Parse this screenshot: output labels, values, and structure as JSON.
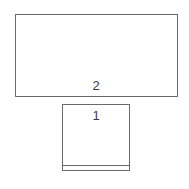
{
  "diagram": {
    "canvas": {
      "width": 189,
      "height": 189,
      "background_color": "#ffffff"
    },
    "stroke_color": "#6a6a6a",
    "label_color": "#3c3c3c",
    "stroke_width": 1,
    "shapes": [
      {
        "id": "rect-2",
        "kind": "rectangle",
        "label": "2",
        "x": 15,
        "y": 14,
        "width": 163,
        "height": 83,
        "label_x": 96,
        "label_y": 79,
        "fill_color": "#ffffff",
        "stroke_color": "#6a6a6a"
      },
      {
        "id": "rect-1",
        "kind": "rectangle",
        "label": "1",
        "x": 62,
        "y": 104,
        "width": 68,
        "height": 67,
        "label_x": 96,
        "label_y": 109,
        "fill_color": "#ffffff",
        "stroke_color": "#6a6a6a",
        "divider": {
          "id": "rect-1-divider",
          "orientation": "horizontal",
          "x": 62,
          "y": 165,
          "length": 68,
          "stroke_color": "#6a6a6a"
        }
      }
    ]
  }
}
